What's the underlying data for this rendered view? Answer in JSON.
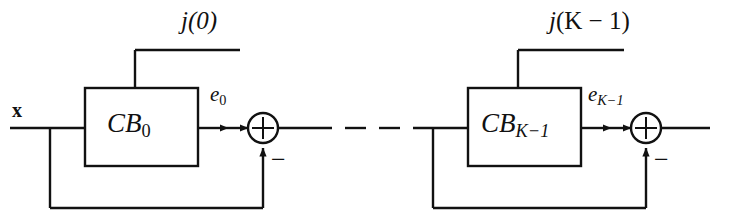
{
  "figure": {
    "kind": "block-diagram",
    "background_color": "#ffffff",
    "line_color": "#111111"
  },
  "labels": {
    "input_signal": "x",
    "stage1": {
      "control_label_prefix": "j",
      "control_label": "j(0)",
      "control_arg": "(0)",
      "block_name_base": "CB",
      "block_name_sub": "0",
      "block_name_full": "CB0",
      "error_label_base": "e",
      "error_label_sub": "0",
      "error_label_full": "e0",
      "feedback_sign": "−"
    },
    "stage2": {
      "control_label_prefix": "j",
      "control_label": "j(K − 1)",
      "control_arg": "(K − 1)",
      "block_name_base": "CB",
      "block_name_sub": "K−1",
      "block_name_full": "CBK-1",
      "error_label_base": "e",
      "error_label_sub": "K−1",
      "error_label_full": "eK-1",
      "feedback_sign": "−"
    },
    "ellipsis": "– –"
  },
  "nodes": {
    "summing_junction_1": {
      "name": "sum-junction-0",
      "symbol": "+",
      "center_x": 263,
      "center_y": 128,
      "radius": 15
    },
    "summing_junction_2": {
      "name": "sum-junction-K-1",
      "symbol": "+",
      "center_x": 646,
      "center_y": 128,
      "radius": 15
    }
  },
  "geometry": {
    "main_line_y": 128,
    "feedback_line_y": 208,
    "control_line_y": 50,
    "block1": {
      "x": 85,
      "y": 88,
      "w": 113,
      "h": 78
    },
    "block2": {
      "x": 468,
      "y": 88,
      "w": 113,
      "h": 78
    },
    "input_line_start_x": 10,
    "output_line_end_x": 710
  }
}
